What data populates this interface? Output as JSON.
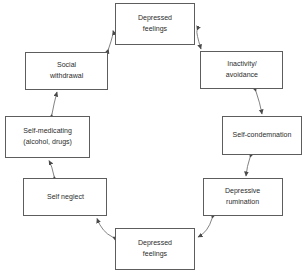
{
  "diagram": {
    "type": "cycle-flowchart",
    "background_color": "#ffffff",
    "box_border_color": "#5d5d5d",
    "text_color": "#2b2b2b",
    "arrow_color": "#4a4a4a",
    "arrow_style": "double-headed-curved",
    "nodes": [
      {
        "id": "top",
        "label": "Depressed\nfeelings",
        "position": "top"
      },
      {
        "id": "inactivity",
        "label": "Inactivity/\navoidance",
        "position": "top-right"
      },
      {
        "id": "selfcondemn",
        "label": "Self-condemnation",
        "position": "right"
      },
      {
        "id": "rumination",
        "label": "Depressive\nrumination",
        "position": "bottom-right"
      },
      {
        "id": "bottom",
        "label": "Depressed\nfeelings",
        "position": "bottom"
      },
      {
        "id": "selfneglect",
        "label": "Self neglect",
        "position": "bottom-left"
      },
      {
        "id": "selfmedicating",
        "label": "Self-medicating\n(alcohol, drugs)",
        "position": "left"
      },
      {
        "id": "social",
        "label": "Social\nwithdrawal",
        "position": "top-left"
      }
    ],
    "connections": [
      {
        "from": "top",
        "to": "inactivity",
        "bidirectional": true
      },
      {
        "from": "inactivity",
        "to": "selfcondemn",
        "bidirectional": true
      },
      {
        "from": "selfcondemn",
        "to": "rumination",
        "bidirectional": true
      },
      {
        "from": "rumination",
        "to": "bottom",
        "bidirectional": true
      },
      {
        "from": "bottom",
        "to": "selfneglect",
        "bidirectional": true
      },
      {
        "from": "selfneglect",
        "to": "selfmedicating",
        "bidirectional": true
      },
      {
        "from": "selfmedicating",
        "to": "social",
        "bidirectional": true
      },
      {
        "from": "social",
        "to": "top",
        "bidirectional": true
      }
    ]
  }
}
